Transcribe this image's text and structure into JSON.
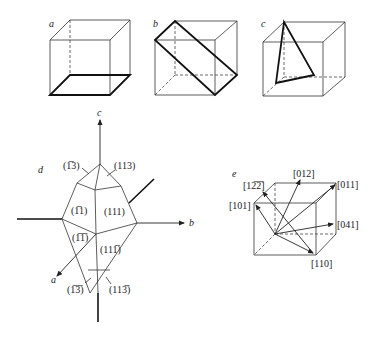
{
  "panels": {
    "a": {
      "label": "a",
      "description": "cube with bold bottom face"
    },
    "b": {
      "label": "b",
      "description": "cube with bold diagonal plane"
    },
    "c": {
      "label": "c",
      "description": "cube with bold triangular plane"
    },
    "d": {
      "label": "d",
      "axes": {
        "a": "a",
        "b": "b",
        "c": "c"
      },
      "faces": {
        "f1m13": "(1̅3)",
        "f113": "(113)",
        "f1m11": "(1̅1)",
        "f111": "(111)",
        "f1m1m1": "(1̅1̅)",
        "f11m1": "(111̅)",
        "f1m1m3": "(1̅3̅)",
        "f11m3": "(113̅)"
      }
    },
    "e": {
      "label": "e",
      "directions": {
        "d1m2m2": "[12̅2̅]",
        "d012": "[012]",
        "d011": "[011]",
        "d101": "[101]",
        "d041": "[041]",
        "d110": "[110]"
      }
    }
  }
}
